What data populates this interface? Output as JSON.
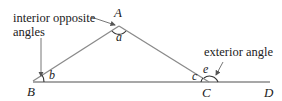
{
  "diagram": {
    "annotations": {
      "interior_line1": "interior opposite",
      "interior_line2": "angles",
      "exterior": "exterior angle"
    },
    "vertices": {
      "A": "A",
      "B": "B",
      "C": "C",
      "D": "D"
    },
    "angles": {
      "a": "a",
      "b": "b",
      "c": "c",
      "e": "e"
    },
    "colors": {
      "line": "#8a8a8a",
      "text": "#222222",
      "arc": "#333333"
    }
  }
}
